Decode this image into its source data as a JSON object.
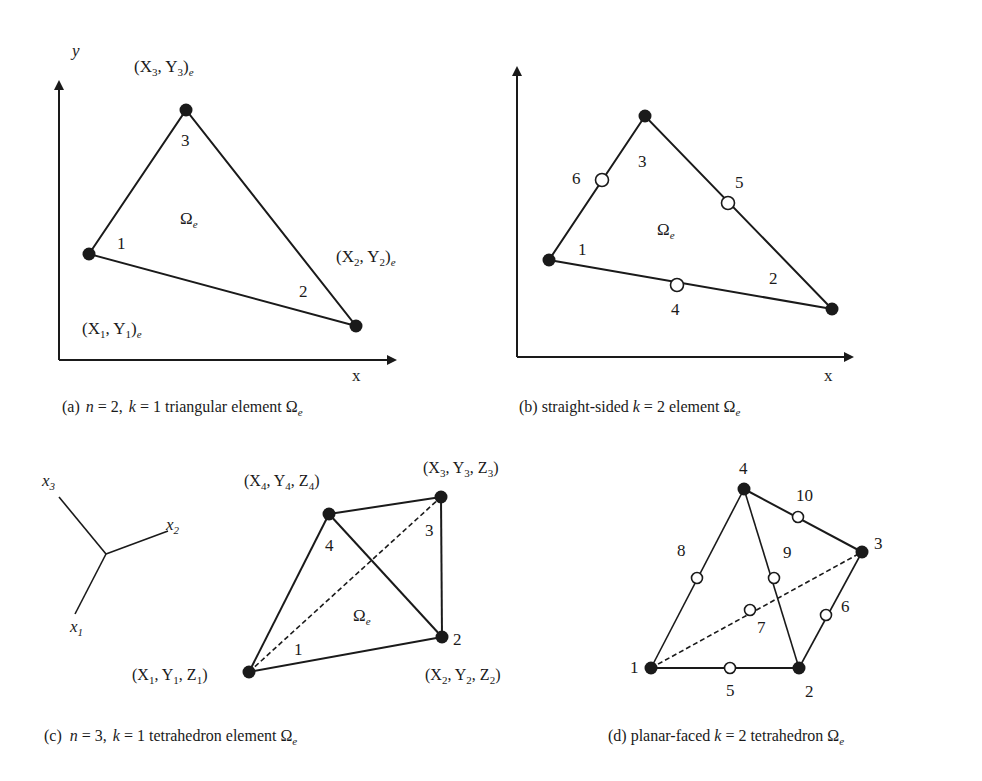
{
  "panels": {
    "a": {
      "caption_prefix": "(a)",
      "caption_n": "n",
      "caption_n_val": " = 2,",
      "caption_k": "k",
      "caption_rest": " = 1 triangular element Ω",
      "caption_sub": "e",
      "axis_y": "y",
      "axis_x": "x",
      "omega": "Ω",
      "omega_sub": "e",
      "nodes": [
        {
          "id": "1",
          "coord": "(X",
          "sub": "1",
          "mid": ", Y",
          "sub2": "1",
          "end": ")",
          "end_sub": "e"
        },
        {
          "id": "2",
          "coord": "(X",
          "sub": "2",
          "mid": ", Y",
          "sub2": "2",
          "end": ")",
          "end_sub": "e"
        },
        {
          "id": "3",
          "coord": "(X",
          "sub": "3",
          "mid": ", Y",
          "sub2": "3",
          "end": ")",
          "end_sub": "e"
        }
      ]
    },
    "b": {
      "caption_prefix": "(b) straight-sided ",
      "caption_k": "k",
      "caption_rest": " = 2 element Ω",
      "caption_sub": "e",
      "axis_y": "y",
      "axis_x": "x",
      "omega": "Ω",
      "omega_sub": "e",
      "vertex_labels": [
        "1",
        "2",
        "3"
      ],
      "midside_labels": [
        "4",
        "5",
        "6"
      ]
    },
    "c": {
      "caption_prefix": "(c) ",
      "caption_n": "n",
      "caption_n_val": " = 3, ",
      "caption_k": "k",
      "caption_rest": " = 1 tetrahedron element Ω",
      "caption_sub": "e",
      "triad": {
        "x1": "x",
        "x1_sub": "1",
        "x2": "x",
        "x2_sub": "2",
        "x3": "x",
        "x3_sub": "3"
      },
      "omega": "Ω",
      "omega_sub": "e",
      "vertex_labels": [
        "1",
        "2",
        "3",
        "4"
      ],
      "coords": [
        {
          "X": "(X",
          "s1": "1",
          "Y": ", Y",
          "s2": "1",
          "Z": ", Z",
          "s3": "1",
          "end": ")"
        },
        {
          "X": "(X",
          "s1": "2",
          "Y": ", Y",
          "s2": "2",
          "Z": ", Z",
          "s3": "2",
          "end": ")"
        },
        {
          "X": "(X",
          "s1": "3",
          "Y": ", Y",
          "s2": "3",
          "Z": ", Z",
          "s3": "3",
          "end": ")"
        },
        {
          "X": "(X",
          "s1": "4",
          "Y": ", Y",
          "s2": "4",
          "Z": ", Z",
          "s3": "4",
          "end": ")"
        }
      ]
    },
    "d": {
      "caption_prefix": "(d) planar-faced ",
      "caption_k": "k",
      "caption_rest": " = 2 tetrahedron Ω",
      "caption_sub": "e",
      "vertex_labels": [
        "1",
        "2",
        "3",
        "4"
      ],
      "midside_labels": [
        "5",
        "6",
        "7",
        "8",
        "9",
        "10"
      ]
    }
  }
}
